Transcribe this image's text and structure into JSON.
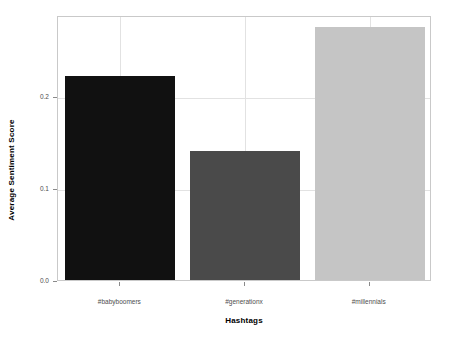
{
  "chart_data": {
    "type": "bar",
    "title": "",
    "xlabel": "Hashtags",
    "ylabel": "Average Sentiment Score",
    "categories": [
      "#babyboomers",
      "#generationx",
      "#millennials"
    ],
    "values": [
      0.221,
      0.14,
      0.274
    ],
    "colors": [
      "#111111",
      "#4a4a4a",
      "#c5c5c5"
    ],
    "ylim": [
      0.0,
      0.2875
    ],
    "yticks": [
      0.0,
      0.1,
      0.2
    ],
    "ytick_labels": [
      "0.0",
      "0.1",
      "0.2"
    ],
    "grid": true,
    "grid_color": "#e2e2e2",
    "legend": null,
    "panel_border_color": "#c9c9c9",
    "background": "#ffffff"
  }
}
